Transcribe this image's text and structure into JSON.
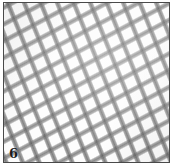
{
  "figure": {
    "caption_label": "6",
    "border_color": "#4a4a4a",
    "background_color": "#ffffff",
    "mesh_color": "#5c5c5c",
    "mesh_color_light": "#969696",
    "panel_color": "#fdfdfd",
    "label_color": "#1d1d1d"
  },
  "mesh": {
    "warp_angle_deg": 68,
    "weft_angle_deg": 152,
    "cell_pitch_px": 15,
    "strand_width_px": 4
  }
}
